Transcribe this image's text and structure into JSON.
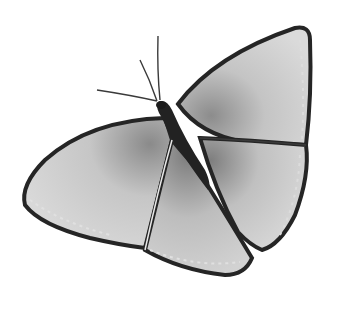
{
  "image": {
    "subject": "butterfly",
    "style": "grayscale watercolor illustration",
    "background": "#ffffff",
    "colors": {
      "wing_light": "#d6d6d6",
      "wing_mid": "#a8a8a8",
      "wing_edge": "#2a2a2a",
      "body": "#222222"
    }
  }
}
